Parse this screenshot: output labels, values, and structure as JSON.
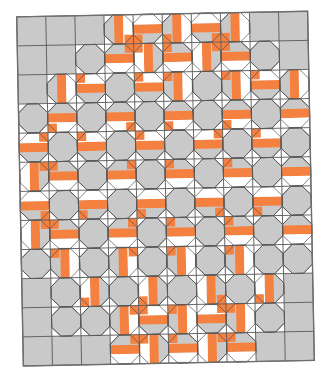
{
  "figure": {
    "name": "quilt-pattern-diagram",
    "title": "",
    "background_color": "#FFFFFF"
  },
  "palette": {
    "gray": "#C9C9C9",
    "white": "#FFFFFF",
    "orange": "#F4813F",
    "grid_line": "#595959",
    "outline": "#4D4D4D",
    "border": "#6E6E6E"
  },
  "geometry": {
    "cols": 10,
    "rows": 12,
    "cell": 29.1,
    "origin_x": 20,
    "origin_y": 14,
    "skew_deg": -1.1,
    "corner_cut": 9.0,
    "strip": 9.0,
    "grid_stroke": 0.9,
    "outline_stroke": 0.8,
    "frame_stroke": 1.0
  },
  "legend": {
    "show": false,
    "entries": [
      {
        "label": "Background",
        "color": "#C9C9C9"
      },
      {
        "label": "Path",
        "color": "#FFFFFF"
      },
      {
        "label": "Accent",
        "color": "#F4813F"
      }
    ]
  },
  "chart_data": {
    "type": "heatmap",
    "xlabel": "",
    "ylabel": "",
    "categories": [
      "c1",
      "c2",
      "c3",
      "c4",
      "c5",
      "c6",
      "c7",
      "c8",
      "c9",
      "c10"
    ],
    "row_labels": [
      "r1",
      "r2",
      "r3",
      "r4",
      "r5",
      "r6",
      "r7",
      "r8",
      "r9",
      "r10",
      "r11",
      "r12"
    ],
    "value_map": {
      "0": "gray",
      "1": "white",
      "2": "orange"
    },
    "comment": "Per-cell block type grid. 0 = plain gray square, 1 = snowball (octagon) block, 2 = snowball block carrying orange strips.",
    "block_grid": [
      [
        0,
        0,
        0,
        2,
        2,
        2,
        2,
        2,
        0,
        0
      ],
      [
        0,
        0,
        1,
        2,
        2,
        2,
        2,
        2,
        1,
        0
      ],
      [
        0,
        2,
        2,
        1,
        2,
        2,
        1,
        2,
        2,
        2
      ],
      [
        1,
        2,
        1,
        2,
        1,
        2,
        1,
        2,
        1,
        2
      ],
      [
        2,
        1,
        2,
        1,
        2,
        1,
        2,
        1,
        2,
        1
      ],
      [
        2,
        2,
        1,
        2,
        1,
        2,
        1,
        2,
        1,
        2
      ],
      [
        2,
        1,
        2,
        1,
        2,
        1,
        2,
        1,
        2,
        1
      ],
      [
        2,
        2,
        1,
        2,
        1,
        2,
        1,
        2,
        1,
        2
      ],
      [
        1,
        2,
        1,
        2,
        1,
        2,
        1,
        2,
        1,
        1
      ],
      [
        0,
        1,
        2,
        1,
        2,
        1,
        2,
        1,
        2,
        0
      ],
      [
        0,
        1,
        1,
        2,
        2,
        2,
        2,
        2,
        1,
        0
      ],
      [
        0,
        0,
        0,
        2,
        2,
        2,
        2,
        2,
        0,
        0
      ]
    ],
    "orange_strip_count": 96,
    "white_strip_count": 104,
    "octagon_count": 61
  }
}
